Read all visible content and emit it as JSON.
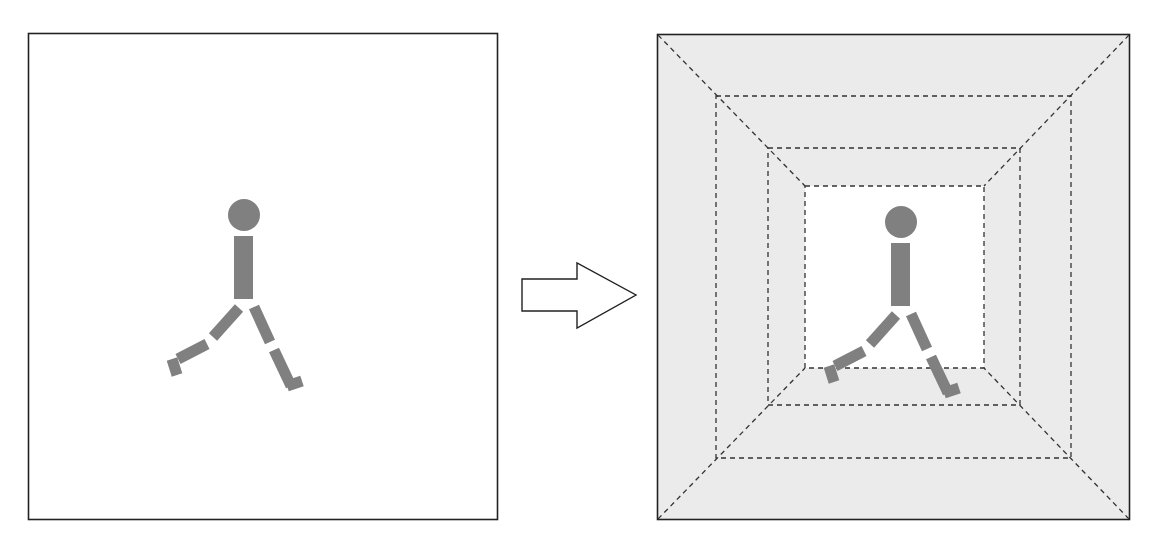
{
  "caption": {
    "text": "",
    "note": "partially cropped caption line at top edge, illegible"
  },
  "diagram": {
    "title": "",
    "left_panel": {
      "label": "original scene",
      "background": "#ffffff",
      "figure": "walking-person"
    },
    "arrow": {
      "direction": "right",
      "meaning": "transform"
    },
    "right_panel": {
      "label": "nested dashed frames (tunnel / perspective)",
      "background": "#ebebeb",
      "inner_background": "#ffffff",
      "nested_frame_count": 3,
      "diagonals": 4,
      "figure": "walking-person"
    },
    "colors": {
      "frame_stroke": "#222222",
      "dash_stroke": "#333333",
      "figure_fill": "#808080",
      "shaded_fill": "#ebebeb"
    }
  }
}
